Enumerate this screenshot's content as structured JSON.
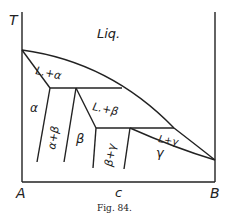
{
  "axes": {
    "y_label": "T",
    "x_left": "A",
    "x_mid": "c",
    "x_right": "B"
  },
  "regions": {
    "liquid": "Liq.",
    "l_alpha": "L.+α",
    "alpha": "α",
    "alpha_beta": "α+β",
    "l_beta": "L.+β",
    "beta": "β",
    "beta_gamma": "β+γ",
    "l_gamma": "L+γ",
    "gamma": "γ"
  },
  "caption": "Fig. 84."
}
